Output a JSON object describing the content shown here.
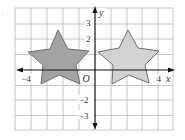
{
  "diagram": {
    "type": "coordinate-grid-reflection",
    "axes": {
      "x_label": "x",
      "y_label": "y",
      "origin_label": "O",
      "x_tick_labels": [
        {
          "value": -4,
          "text": "−4"
        },
        {
          "value": 4,
          "text": "4"
        }
      ],
      "y_tick_labels": [
        {
          "value": 3,
          "text": "3"
        },
        {
          "value": 2,
          "text": "2"
        },
        {
          "value": -2,
          "text": "−2"
        },
        {
          "value": -3,
          "text": "−3"
        }
      ],
      "x_range": [
        -5,
        5
      ],
      "y_range": [
        -4,
        4
      ]
    },
    "grid": {
      "show": true,
      "color": "#b8b8b8",
      "unit_px": 15.8
    },
    "shapes": [
      {
        "name": "left-star",
        "fill": "#a3a3a3",
        "stroke": "#6e6e6e",
        "points_px": [
          [
            58,
            30
          ],
          [
            68,
            49
          ],
          [
            89,
            51
          ],
          [
            76,
            65
          ],
          [
            80,
            84
          ],
          [
            59,
            75
          ],
          [
            41,
            84
          ],
          [
            43,
            65
          ],
          [
            28,
            52
          ],
          [
            50,
            49
          ]
        ]
      },
      {
        "name": "right-star",
        "fill": "#d2d2d2",
        "stroke": "#6e6e6e",
        "points_px": [
          [
            128,
            30
          ],
          [
            138,
            48
          ],
          [
            159,
            51
          ],
          [
            145,
            65
          ],
          [
            149,
            83
          ],
          [
            129,
            75
          ],
          [
            112,
            84
          ],
          [
            113,
            65
          ],
          [
            98,
            52
          ],
          [
            119,
            48
          ]
        ]
      }
    ]
  }
}
